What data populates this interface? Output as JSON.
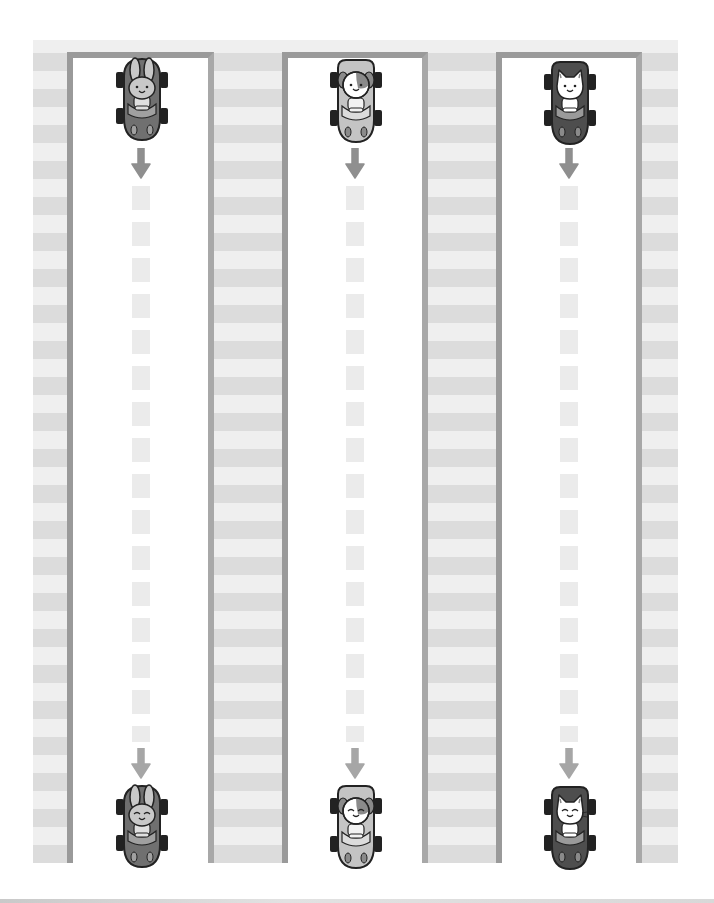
{
  "worksheet": {
    "type": "tracing-worksheet",
    "description": "Three vertical lanes, each with an animal driving a car at the top and bottom, connected by a dashed line with arrows pointing down",
    "colors": {
      "stripe_dark": "#dcdcdc",
      "stripe_light": "#efefef",
      "lane_border": "#9a9a9a",
      "dash": "#ebebeb",
      "arrow": "#8f8f8f"
    },
    "lanes": [
      {
        "animal": "bunny",
        "car_color": "#707070",
        "face_color": "#c8c8c8",
        "top_expression": "smile",
        "bottom_expression": "happy-closed-eyes"
      },
      {
        "animal": "puppy",
        "car_color": "#c4c4c4",
        "face_color": "#ffffff",
        "top_expression": "smile",
        "bottom_expression": "happy-closed-eyes"
      },
      {
        "animal": "kitten",
        "car_color": "#4e4e4e",
        "face_color": "#ffffff",
        "top_expression": "smile",
        "bottom_expression": "happy-closed-eyes"
      }
    ]
  }
}
